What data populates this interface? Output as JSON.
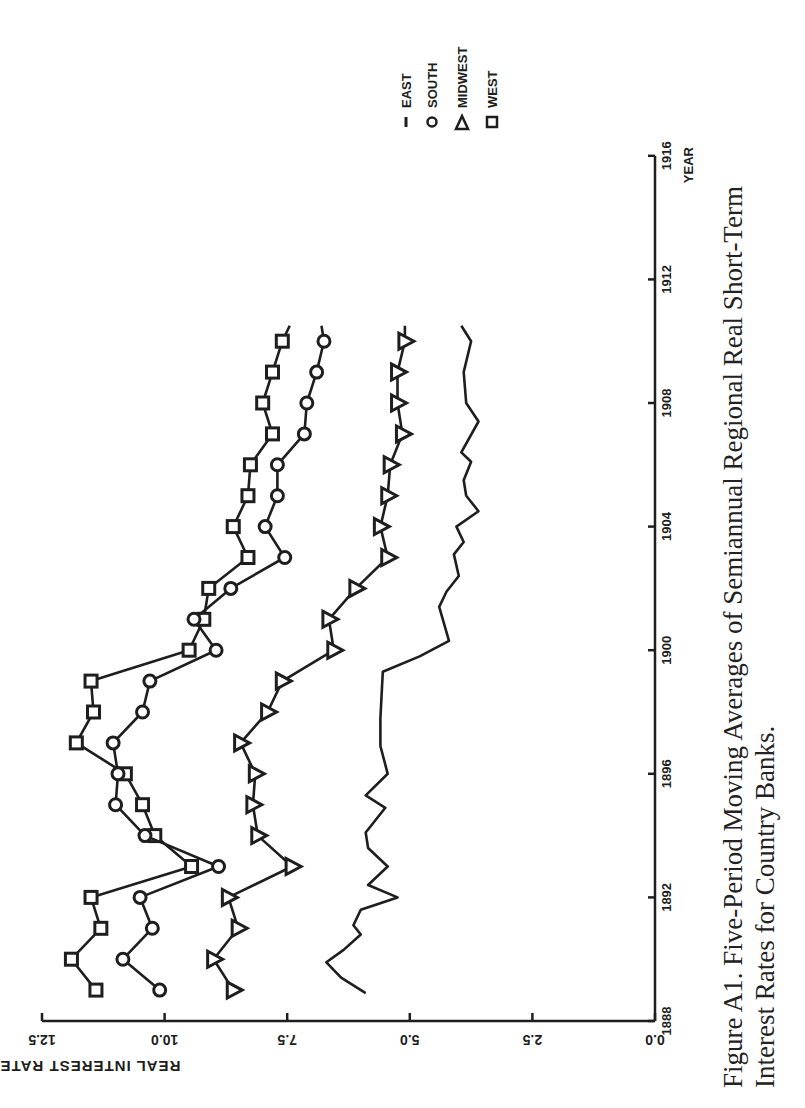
{
  "chart_data": {
    "type": "line",
    "caption_line1": "Figure A1. Five-Period Moving Averages of Semiannual Regional Real Short-Term",
    "caption_line2": "Interest Rates for Country Banks.",
    "xlabel": "YEAR",
    "ylabel": "REAL INTEREST RATE",
    "xlim": [
      1888,
      1916
    ],
    "ylim": [
      0.0,
      12.5
    ],
    "xticks": [
      "1888",
      "1892",
      "1896",
      "1900",
      "1904",
      "1908",
      "1912",
      "1916"
    ],
    "yticks": [
      "0.0",
      "2.5",
      "5.0",
      "7.5",
      "10.0",
      "12.5"
    ],
    "grid": false,
    "legend_position": "upper-right (rotated)",
    "orientation": "rotated 90 degrees counterclockwise",
    "legend": [
      {
        "name": "EAST",
        "marker": "dash"
      },
      {
        "name": "SOUTH",
        "marker": "circle"
      },
      {
        "name": "MIDWEST",
        "marker": "triangle"
      },
      {
        "name": "WEST",
        "marker": "square"
      }
    ],
    "series": [
      {
        "name": "WEST",
        "marker": "square",
        "x": [
          1889,
          1890,
          1891,
          1892,
          1893,
          1894,
          1895,
          1896,
          1897,
          1898,
          1899,
          1900,
          1901,
          1902,
          1903,
          1904,
          1905,
          1906,
          1907,
          1908,
          1909,
          1910,
          1910.5
        ],
        "values": [
          11.4,
          11.9,
          11.3,
          11.5,
          9.45,
          10.2,
          10.45,
          10.8,
          11.8,
          11.45,
          11.5,
          9.5,
          9.2,
          9.1,
          8.3,
          8.6,
          8.3,
          8.25,
          7.8,
          8.0,
          7.8,
          7.6,
          7.45
        ]
      },
      {
        "name": "SOUTH",
        "marker": "circle",
        "x": [
          1889,
          1890,
          1891,
          1892,
          1893,
          1894,
          1895,
          1896,
          1897,
          1898,
          1899,
          1900,
          1901,
          1902,
          1903,
          1904,
          1905,
          1906,
          1907,
          1908,
          1909,
          1910,
          1910.5
        ],
        "values": [
          10.1,
          10.85,
          10.25,
          10.5,
          8.9,
          10.4,
          11.0,
          10.95,
          11.05,
          10.45,
          10.3,
          8.95,
          9.4,
          8.65,
          7.55,
          7.95,
          7.7,
          7.7,
          7.15,
          7.1,
          6.9,
          6.75,
          6.8
        ]
      },
      {
        "name": "MIDWEST",
        "marker": "triangle",
        "x": [
          1889,
          1890,
          1891,
          1892,
          1893,
          1894,
          1895,
          1896,
          1897,
          1898,
          1899,
          1900,
          1901,
          1902,
          1903,
          1904,
          1905,
          1906,
          1907,
          1908,
          1909,
          1910,
          1910.5
        ],
        "values": [
          8.6,
          9.0,
          8.5,
          8.7,
          7.4,
          8.1,
          8.2,
          8.15,
          8.45,
          7.9,
          7.6,
          6.55,
          6.65,
          6.1,
          5.45,
          5.6,
          5.45,
          5.4,
          5.15,
          5.25,
          5.25,
          5.1,
          5.1
        ]
      },
      {
        "name": "EAST",
        "marker": "none",
        "x": [
          1888.9,
          1889.4,
          1889.9,
          1890.3,
          1890.8,
          1891.1,
          1891.6,
          1892.0,
          1892.4,
          1893.0,
          1893.6,
          1894.1,
          1894.9,
          1895.3,
          1896.0,
          1896.9,
          1897.3,
          1897.8,
          1899.3,
          1899.8,
          1900.3,
          1901.4,
          1901.9,
          1902.4,
          1903.1,
          1903.5,
          1904.0,
          1904.5,
          1905.0,
          1905.5,
          1906.1,
          1906.4,
          1907.4,
          1908.0,
          1909.0,
          1910.0,
          1910.5
        ],
        "values": [
          5.9,
          6.4,
          6.7,
          6.35,
          6.0,
          6.15,
          6.0,
          5.25,
          5.85,
          5.45,
          5.85,
          5.9,
          5.5,
          5.9,
          5.45,
          5.6,
          5.6,
          5.6,
          5.55,
          4.8,
          4.2,
          4.4,
          4.25,
          4.0,
          4.1,
          3.9,
          4.05,
          3.6,
          3.85,
          3.9,
          3.75,
          3.95,
          3.6,
          3.85,
          3.9,
          3.75,
          3.95
        ]
      }
    ]
  }
}
